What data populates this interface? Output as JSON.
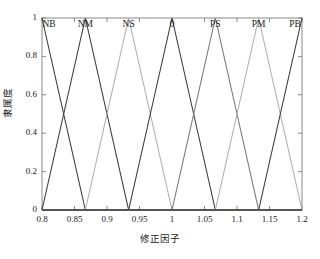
{
  "chart_data": {
    "type": "line",
    "title": "",
    "xlabel": "修正因子",
    "ylabel": "隶属度",
    "xlim": [
      0.8,
      1.2
    ],
    "ylim": [
      0,
      1
    ],
    "grid": false,
    "legend_position": "inside-top",
    "x_ticks": [
      "0.8",
      "0.85",
      "0.9",
      "0.95",
      "1",
      "1.05",
      "1.1",
      "1.15",
      "1.2"
    ],
    "x_tick_values": [
      0.8,
      0.85,
      0.9,
      0.95,
      1.0,
      1.05,
      1.1,
      1.15,
      1.2
    ],
    "y_ticks": [
      "0",
      "0.2",
      "0.4",
      "0.6",
      "0.8",
      "1"
    ],
    "y_tick_values": [
      0,
      0.2,
      0.4,
      0.6,
      0.8,
      1
    ],
    "annotations": [
      "NB",
      "NM",
      "NS",
      "0",
      "PS",
      "PM",
      "PB"
    ],
    "series": [
      {
        "name": "NB",
        "color": "#3d3d3d",
        "peak": 0.8,
        "left": 0.7333,
        "right": 0.8667,
        "x": [
          0.8,
          0.8667,
          1.2
        ],
        "values": [
          1,
          0,
          0
        ]
      },
      {
        "name": "NM",
        "color": "#3d3d3d",
        "peak": 0.8667,
        "left": 0.8,
        "right": 0.9333,
        "x": [
          0.8,
          0.8667,
          0.9333,
          1.2
        ],
        "values": [
          0,
          1,
          0,
          0
        ]
      },
      {
        "name": "NS",
        "color": "#b0b0b0",
        "peak": 0.9333,
        "left": 0.8667,
        "right": 1.0,
        "x": [
          0.8,
          0.8667,
          0.9333,
          1.0,
          1.2
        ],
        "values": [
          0,
          0,
          1,
          0,
          0
        ]
      },
      {
        "name": "0",
        "color": "#3d3d3d",
        "peak": 1.0,
        "left": 0.9333,
        "right": 1.0667,
        "x": [
          0.8,
          0.9333,
          1.0,
          1.0667,
          1.2
        ],
        "values": [
          0,
          0,
          1,
          0,
          0
        ]
      },
      {
        "name": "PS",
        "color": "#7a7a7a",
        "peak": 1.0667,
        "left": 1.0,
        "right": 1.1333,
        "x": [
          0.8,
          1.0,
          1.0667,
          1.1333,
          1.2
        ],
        "values": [
          0,
          0,
          1,
          0,
          0
        ]
      },
      {
        "name": "PM",
        "color": "#b0b0b0",
        "peak": 1.1333,
        "left": 1.0667,
        "right": 1.2,
        "x": [
          0.8,
          1.0667,
          1.1333,
          1.2
        ],
        "values": [
          0,
          0,
          1,
          0
        ]
      },
      {
        "name": "PB",
        "color": "#3d3d3d",
        "peak": 1.2,
        "left": 1.1333,
        "right": 1.2667,
        "x": [
          0.8,
          1.1333,
          1.2
        ],
        "values": [
          0,
          0,
          1
        ]
      }
    ],
    "baseline": {
      "name": "zero-baseline",
      "color": "#555555",
      "y": 0
    }
  },
  "axes": {
    "box_color": "#8a8a8a",
    "tick_color": "#8a8a8a",
    "background": "#ffffff"
  }
}
